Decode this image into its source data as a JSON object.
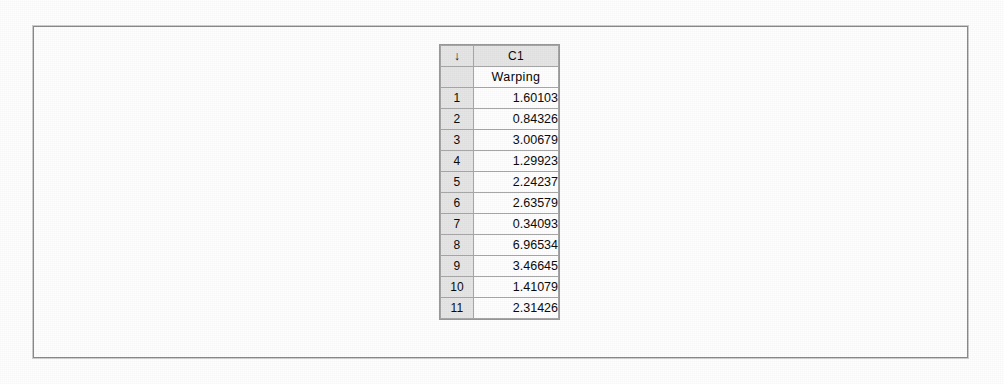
{
  "worksheet": {
    "select_all_icon": "down-arrow",
    "select_all_glyph": "↓",
    "column_id": "C1",
    "column_label": "Warping",
    "row_numbers": [
      "1",
      "2",
      "3",
      "4",
      "5",
      "6",
      "7",
      "8",
      "9",
      "10",
      "11"
    ],
    "values": [
      "1.60103",
      "0.84326",
      "3.00679",
      "1.29923",
      "2.24237",
      "2.63579",
      "0.34093",
      "6.96534",
      "3.46645",
      "1.41079",
      "2.31426"
    ],
    "colors": {
      "header_background": "#e6e6e6",
      "cell_background": "#ffffff",
      "grid_line": "#a8a8a8",
      "text": "#0b0b0b",
      "frame_border": "#8a8a8a"
    }
  }
}
